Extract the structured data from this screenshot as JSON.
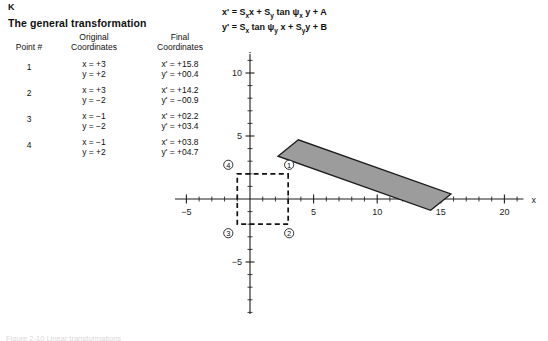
{
  "panel": {
    "label": "K",
    "title": "The general transformation"
  },
  "table": {
    "headers": {
      "point": "Point #",
      "original_line1": "Original",
      "original_line2": "Coordinates",
      "final_line1": "Final",
      "final_line2": "Coordinates"
    },
    "rows": [
      {
        "point": "1",
        "orig_x": "x = +3",
        "orig_y": "y = +2",
        "final_x": "x' = +15.8",
        "final_y": "y' = +00.4"
      },
      {
        "point": "2",
        "orig_x": "x = +3",
        "orig_y": "y = −2",
        "final_x": "x' = +14.2",
        "final_y": "y' = −00.9"
      },
      {
        "point": "3",
        "orig_x": "x = −1",
        "orig_y": "y = −2",
        "final_x": "x' = +02.2",
        "final_y": "y' = +03.4"
      },
      {
        "point": "4",
        "orig_x": "x = −1",
        "orig_y": "y = +2",
        "final_x": "x' = +03.8",
        "final_y": "y' = +04.7"
      }
    ]
  },
  "equations": {
    "line1_parts": [
      "x' = S",
      "x",
      "x + S",
      "y",
      " tan ψ",
      "x",
      " y + A"
    ],
    "line2_parts": [
      "y' = S",
      "x",
      " tan ψ",
      "y",
      " x + S",
      "y",
      "y + B"
    ],
    "line1_plain": "x' = Sxx + Sy tan ψx y + A",
    "line2_plain": "y' = Sx tan ψy x + Syy + B"
  },
  "caption": {
    "text": "Figure 2-10  Linear transformations"
  },
  "chart_data": {
    "type": "scatter",
    "title": "",
    "xlabel": "x",
    "ylabel": "y",
    "xlim": [
      -7,
      21.5
    ],
    "ylim": [
      -11.5,
      11.5
    ],
    "x_major_ticks": [
      -5,
      5,
      10,
      15,
      20
    ],
    "x_tick_labels": [
      "−5",
      "5",
      "10",
      "15",
      "20"
    ],
    "y_major_ticks": [
      -10,
      -5,
      5,
      10
    ],
    "y_tick_labels": [
      "−10",
      "−5",
      "5",
      "10"
    ],
    "minor_tick_step": 1,
    "grid": false,
    "original_shape": {
      "name": "original-rectangle",
      "style": "dashed",
      "color": "#111111",
      "vertices": [
        {
          "label": "1",
          "x": 3,
          "y": 2
        },
        {
          "label": "2",
          "x": 3,
          "y": -2
        },
        {
          "label": "3",
          "x": -1,
          "y": -2
        },
        {
          "label": "4",
          "x": -1,
          "y": 2
        }
      ]
    },
    "transformed_shape": {
      "name": "transformed-parallelogram",
      "style": "filled",
      "fill": "#9c9c9c",
      "stroke": "#1b1b1b",
      "vertices": [
        {
          "label": "1",
          "x": 15.8,
          "y": 0.4
        },
        {
          "label": "2",
          "x": 14.2,
          "y": -0.9
        },
        {
          "label": "3",
          "x": 2.2,
          "y": 3.4
        },
        {
          "label": "4",
          "x": 3.8,
          "y": 4.7
        }
      ]
    },
    "point_markers": [
      "1",
      "2",
      "3",
      "4"
    ]
  }
}
